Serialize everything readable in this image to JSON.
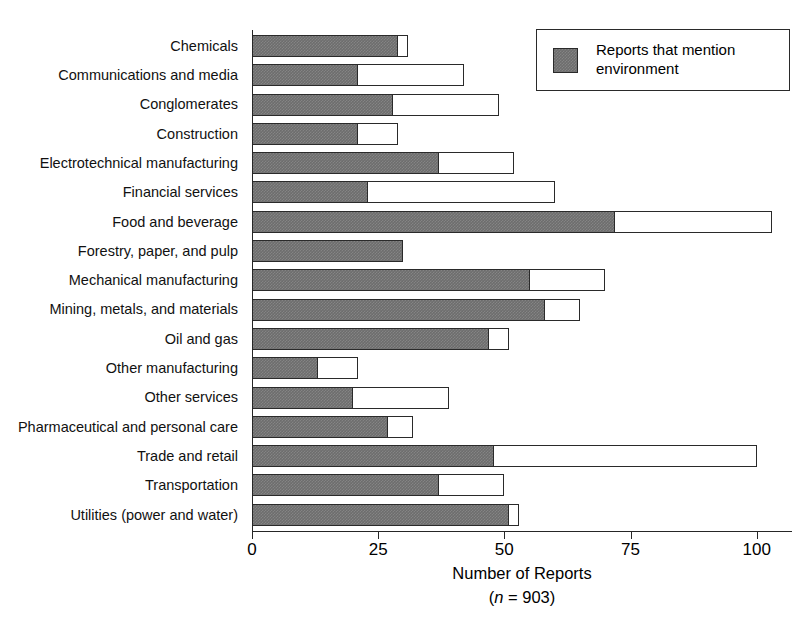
{
  "chart_data": {
    "type": "bar",
    "orientation": "horizontal",
    "stacked": false,
    "title": "",
    "xlabel": "Number of Reports",
    "xlabel_note": "(n = 903)",
    "ylabel": "",
    "xlim": [
      0,
      107
    ],
    "xticks": [
      0,
      25,
      50,
      75,
      100
    ],
    "xticklabels": [
      "0",
      "25",
      "50",
      "75",
      "100"
    ],
    "grid": false,
    "legend_position": "top-right",
    "categories": [
      "Chemicals",
      "Communications and media",
      "Conglomerates",
      "Construction",
      "Electrotechnical manufacturing",
      "Financial services",
      "Food and beverage",
      "Forestry, paper, and pulp",
      "Mechanical manufacturing",
      "Mining, metals, and materials",
      "Oil and gas",
      "Other manufacturing",
      "Other services",
      "Pharmaceutical and personal care",
      "Trade and retail",
      "Transportation",
      "Utilities (power and water)"
    ],
    "series": [
      {
        "name": "Total reports",
        "style": "white-outline",
        "values": [
          31,
          42,
          49,
          29,
          52,
          60,
          103,
          30,
          70,
          65,
          51,
          21,
          39,
          32,
          100,
          50,
          53
        ]
      },
      {
        "name": "Reports that mention environment",
        "style": "gray-filled",
        "values": [
          29,
          21,
          28,
          21,
          37,
          23,
          72,
          30,
          55,
          58,
          47,
          13,
          20,
          27,
          48,
          37,
          51
        ]
      }
    ]
  },
  "legend": {
    "entries": [
      {
        "label": "Reports that mention environment",
        "swatch": "gray-filled"
      }
    ]
  },
  "colors": {
    "bar_fill_dark": "#6d6d6d",
    "bar_fill_light": "#ffffff",
    "bar_outline": "#2a2a2a",
    "axis": "#262626",
    "text": "#000000",
    "background": "#ffffff"
  }
}
